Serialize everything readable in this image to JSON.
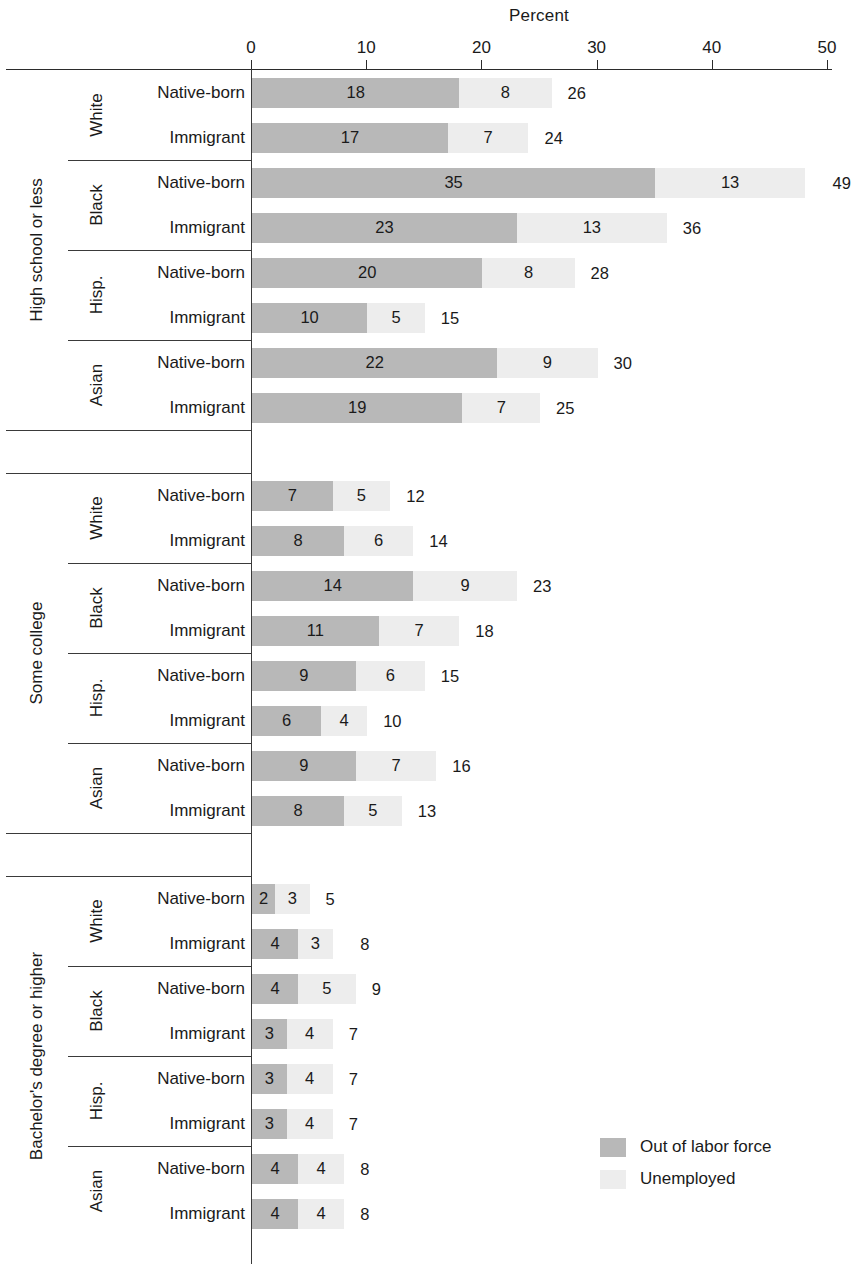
{
  "chart_data": {
    "type": "bar",
    "subtype": "stacked-horizontal-grouped",
    "title": "Percent",
    "xlabel": "Percent",
    "ylabel": "",
    "xlim": [
      0,
      50
    ],
    "xticks": [
      0,
      10,
      20,
      30,
      40,
      50
    ],
    "grid": false,
    "legend_position": "bottom-right",
    "series": [
      {
        "name": "Out of labor force",
        "key": "olf",
        "color": "#b8b8b8"
      },
      {
        "name": "Unemployed",
        "key": "unemp",
        "color": "#ededed"
      }
    ],
    "groups": [
      {
        "education": "High school or less",
        "races": [
          {
            "race": "White",
            "rows": [
              {
                "nativity": "Native-born",
                "olf": 18,
                "unemp": 8,
                "total": 26
              },
              {
                "nativity": "Immigrant",
                "olf": 17,
                "unemp": 7,
                "total": 24
              }
            ]
          },
          {
            "race": "Black",
            "rows": [
              {
                "nativity": "Native-born",
                "olf": 35,
                "unemp": 13,
                "total": 49
              },
              {
                "nativity": "Immigrant",
                "olf": 23,
                "unemp": 13,
                "total": 36
              }
            ]
          },
          {
            "race": "Hisp.",
            "rows": [
              {
                "nativity": "Native-born",
                "olf": 20,
                "unemp": 8,
                "total": 28
              },
              {
                "nativity": "Immigrant",
                "olf": 10,
                "unemp": 5,
                "total": 15
              }
            ]
          },
          {
            "race": "Asian",
            "rows": [
              {
                "nativity": "Native-born",
                "olf": 22,
                "unemp": 9,
                "total": 30
              },
              {
                "nativity": "Immigrant",
                "olf": 19,
                "unemp": 7,
                "total": 25
              }
            ]
          }
        ]
      },
      {
        "education": "Some college",
        "races": [
          {
            "race": "White",
            "rows": [
              {
                "nativity": "Native-born",
                "olf": 7,
                "unemp": 5,
                "total": 12
              },
              {
                "nativity": "Immigrant",
                "olf": 8,
                "unemp": 6,
                "total": 14
              }
            ]
          },
          {
            "race": "Black",
            "rows": [
              {
                "nativity": "Native-born",
                "olf": 14,
                "unemp": 9,
                "total": 23
              },
              {
                "nativity": "Immigrant",
                "olf": 11,
                "unemp": 7,
                "total": 18
              }
            ]
          },
          {
            "race": "Hisp.",
            "rows": [
              {
                "nativity": "Native-born",
                "olf": 9,
                "unemp": 6,
                "total": 15
              },
              {
                "nativity": "Immigrant",
                "olf": 6,
                "unemp": 4,
                "total": 10
              }
            ]
          },
          {
            "race": "Asian",
            "rows": [
              {
                "nativity": "Native-born",
                "olf": 9,
                "unemp": 7,
                "total": 16
              },
              {
                "nativity": "Immigrant",
                "olf": 8,
                "unemp": 5,
                "total": 13
              }
            ]
          }
        ]
      },
      {
        "education": "Bachelor's degree or higher",
        "races": [
          {
            "race": "White",
            "rows": [
              {
                "nativity": "Native-born",
                "olf": 2,
                "unemp": 3,
                "total": 5
              },
              {
                "nativity": "Immigrant",
                "olf": 4,
                "unemp": 3,
                "total": 8
              }
            ]
          },
          {
            "race": "Black",
            "rows": [
              {
                "nativity": "Native-born",
                "olf": 4,
                "unemp": 5,
                "total": 9
              },
              {
                "nativity": "Immigrant",
                "olf": 3,
                "unemp": 4,
                "total": 7
              }
            ]
          },
          {
            "race": "Hisp.",
            "rows": [
              {
                "nativity": "Native-born",
                "olf": 3,
                "unemp": 4,
                "total": 7
              },
              {
                "nativity": "Immigrant",
                "olf": 3,
                "unemp": 4,
                "total": 7
              }
            ]
          },
          {
            "race": "Asian",
            "rows": [
              {
                "nativity": "Native-born",
                "olf": 4,
                "unemp": 4,
                "total": 8
              },
              {
                "nativity": "Immigrant",
                "olf": 4,
                "unemp": 4,
                "total": 8
              }
            ]
          }
        ]
      }
    ]
  }
}
